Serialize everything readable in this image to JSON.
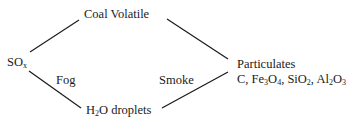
{
  "diagram": {
    "nodes": {
      "coal_volatile": {
        "text": "Coal Volatile"
      },
      "sox": {
        "main": "SO",
        "sub": "x"
      },
      "h2o_droplets": {
        "pre": "H",
        "sub": "2",
        "post": "O droplets"
      },
      "particulates": {
        "title": "Particulates",
        "composition": [
          {
            "pre": "C, Fe",
            "sub1": "3",
            "mid": "O",
            "sub2": "4",
            "post": ","
          },
          {
            "pre": " SiO",
            "sub1": "2",
            "post": ","
          },
          {
            "pre": " Al",
            "sub1": "2",
            "mid": "O",
            "sub2": "3"
          }
        ]
      }
    },
    "edge_labels": {
      "fog": "Fog",
      "smoke": "Smoke"
    },
    "edges": [
      {
        "from": "sox",
        "to": "coal_volatile"
      },
      {
        "from": "sox",
        "to": "h2o_droplets",
        "label": "Fog"
      },
      {
        "from": "coal_volatile",
        "to": "particulates"
      },
      {
        "from": "h2o_droplets",
        "to": "particulates",
        "label": "Smoke"
      }
    ],
    "line_color": "#1a1a1a"
  }
}
